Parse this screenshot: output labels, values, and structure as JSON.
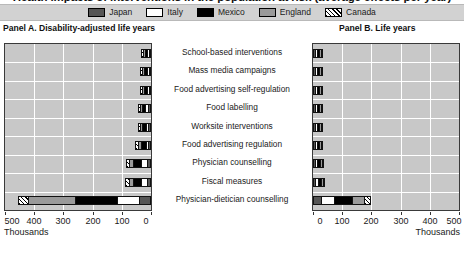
{
  "title": "Health impacts of interventions in the population at risk (average effects per year)",
  "legend": {
    "position": "top",
    "items": [
      {
        "label": "Japan",
        "key": "japan",
        "color": "#555555",
        "pattern": "solid"
      },
      {
        "label": "Italy",
        "key": "italy",
        "color": "#ffffff",
        "pattern": "solid"
      },
      {
        "label": "Mexico",
        "key": "mexico",
        "color": "#000000",
        "pattern": "solid"
      },
      {
        "label": "England",
        "key": "england",
        "color": "#9a9a9a",
        "pattern": "solid"
      },
      {
        "label": "Canada",
        "key": "canada",
        "color": "#ffffff",
        "pattern": "diagonal-hatch"
      }
    ]
  },
  "panels": [
    {
      "id": "A",
      "caption": "Panel A. Disability-adjusted life years"
    },
    {
      "id": "B",
      "caption": "Panel B. Life years"
    }
  ],
  "axis_units": "Thousands",
  "chart_data": {
    "type": "bar",
    "orientation": "horizontal",
    "layout": "back-to-back stacked bars, shared category axis in centre",
    "title": "Health impacts of interventions in the population at risk (average effects per year)",
    "grid": true,
    "legend_position": "top",
    "series_names": [
      "Japan",
      "Italy",
      "Mexico",
      "England",
      "Canada"
    ],
    "categories": [
      "School-based interventions",
      "Mass media campaigns",
      "Food advertising self-regulation",
      "Food labelling",
      "Worksite interventions",
      "Food advertising regulation",
      "Physician counselling",
      "Fiscal measures",
      "Physician-dietician counselling"
    ],
    "panels": [
      {
        "id": "A",
        "title": "Panel A. Disability-adjusted life years",
        "xlabel": "Thousands",
        "ylabel": "",
        "xlim": [
          0,
          500
        ],
        "axis_direction": "reversed",
        "xticks": [
          500,
          400,
          300,
          200,
          100,
          0
        ],
        "xticklabels": [
          "500",
          "400",
          "300",
          "200",
          "100",
          "0"
        ],
        "series": [
          {
            "name": "Japan",
            "values": [
              6,
              7,
              6,
              9,
              9,
              10,
              14,
              14,
              40
            ]
          },
          {
            "name": "Italy",
            "values": [
              3,
              3,
              4,
              10,
              5,
              6,
              22,
              22,
              75
            ]
          },
          {
            "name": "Mexico",
            "values": [
              8,
              9,
              10,
              9,
              12,
              16,
              26,
              27,
              145
            ]
          },
          {
            "name": "England",
            "values": [
              4,
              4,
              6,
              7,
              7,
              10,
              12,
              14,
              160
            ]
          },
          {
            "name": "Canada",
            "values": [
              2,
              2,
              5,
              6,
              8,
              9,
              11,
              12,
              35
            ]
          }
        ],
        "totals": [
          23,
          25,
          31,
          41,
          41,
          51,
          85,
          89,
          455
        ]
      },
      {
        "id": "B",
        "title": "Panel B. Life years",
        "xlabel": "Thousands",
        "ylabel": "",
        "xlim": [
          0,
          500
        ],
        "axis_direction": "normal",
        "xticks": [
          0,
          100,
          200,
          300,
          400,
          500
        ],
        "xticklabels": [
          "0",
          "100",
          "200",
          "300",
          "400",
          "500"
        ],
        "series": [
          {
            "name": "Japan",
            "values": [
              3,
              4,
              4,
              6,
              6,
              6,
              8,
              8,
              28
            ]
          },
          {
            "name": "Italy",
            "values": [
              2,
              2,
              2,
              3,
              3,
              4,
              8,
              9,
              45
            ]
          },
          {
            "name": "Mexico",
            "values": [
              3,
              4,
              4,
              4,
              5,
              6,
              9,
              10,
              60
            ]
          },
          {
            "name": "England",
            "values": [
              2,
              2,
              3,
              3,
              4,
              5,
              6,
              6,
              42
            ]
          },
          {
            "name": "Canada",
            "values": [
              1,
              1,
              2,
              2,
              3,
              3,
              4,
              4,
              25
            ]
          }
        ],
        "totals": [
          11,
          13,
          15,
          18,
          21,
          24,
          35,
          37,
          200
        ]
      }
    ]
  }
}
